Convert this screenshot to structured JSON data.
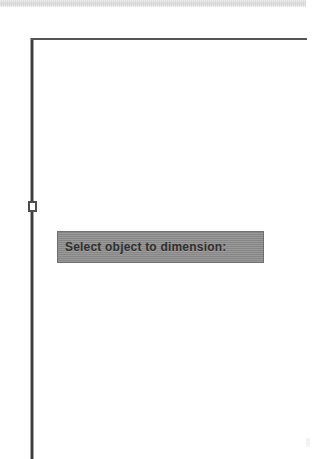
{
  "app": {
    "title": "CAD Drawing Canvas",
    "background_color": "#ffffff"
  },
  "toolbar": {
    "name": "toolbar-strip",
    "visible": true,
    "color": "#e3e3e3"
  },
  "canvas": {
    "name": "drawing-canvas",
    "geometry": [
      {
        "id": "vertical-line",
        "type": "line",
        "x1": 32,
        "y1": 38,
        "x2": 32,
        "y2": 459,
        "color": "#4a4a4a",
        "width": 3
      },
      {
        "id": "horizontal-line",
        "type": "line",
        "x1": 31,
        "y1": 39,
        "x2": 307,
        "y2": 39,
        "color": "#555555",
        "width": 2
      }
    ],
    "grip": {
      "name": "selection-grip",
      "x": 28,
      "y": 201,
      "size": "9x11",
      "fill": "#ffffff",
      "stroke": "#4c4c4c"
    }
  },
  "prompt": {
    "name": "command-prompt-tooltip",
    "text": "Select object to dimension:",
    "background_color": "#8d8d8d",
    "border_color": "#6f6f6f",
    "text_color": "#2e2e2e"
  },
  "artifacts": {
    "faint_mark_color": "#f3f3f3"
  }
}
